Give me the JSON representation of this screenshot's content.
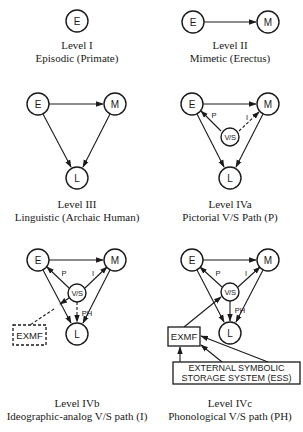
{
  "panels": [
    {
      "id": "level-1",
      "title": "Level I",
      "subtitle": "Episodic (Primate)"
    },
    {
      "id": "level-2",
      "title": "Level II",
      "subtitle": "Mimetic (Erectus)"
    },
    {
      "id": "level-3",
      "title": "Level III",
      "subtitle": "Linguistic (Archaic Human)"
    },
    {
      "id": "level-4a",
      "title": "Level IVa",
      "subtitle": "Pictorial V/S Path (P)"
    },
    {
      "id": "level-4b",
      "title": "Level IVb",
      "subtitle": "Ideographic-analog V/S path (I)"
    },
    {
      "id": "level-4c",
      "title": "Level IVc",
      "subtitle": "Phonological V/S path (PH)"
    }
  ],
  "nodes": {
    "episodic": "E",
    "mimetic": "M",
    "linguistic": "L",
    "visuosymbolic": "V/S"
  },
  "edge_labels": {
    "pictorial": "P",
    "ideographic": "I",
    "phonological": "PH"
  },
  "boxes": {
    "exmf": "EXMF",
    "ess_line1": "EXTERNAL SYMBOLIC",
    "ess_line2": "STORAGE SYSTEM (ESS)"
  },
  "colors": {
    "ink": "#1a1a1a",
    "background": "#ffffff"
  }
}
